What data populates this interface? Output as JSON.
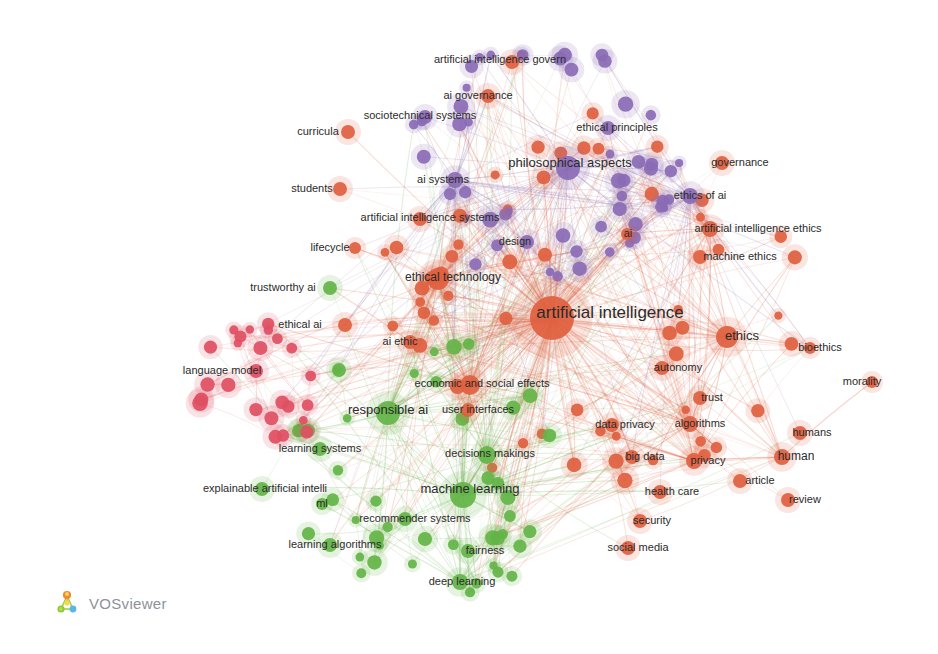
{
  "app": {
    "name": "VOSviewer",
    "logo_label": "VOSviewer",
    "background_color": "#ffffff",
    "width": 938,
    "height": 654
  },
  "chart_data": {
    "type": "scatter",
    "title": "",
    "xlabel": "",
    "ylabel": "",
    "grid": false,
    "legend": "none",
    "visualization": "network",
    "clusters": [
      {
        "id": 1,
        "color": "#e0603f",
        "name": "red-orange"
      },
      {
        "id": 2,
        "color": "#63b446",
        "name": "green"
      },
      {
        "id": 3,
        "color": "#8a6bb5",
        "name": "purple"
      },
      {
        "id": 4,
        "color": "#df4f63",
        "name": "crimson"
      }
    ],
    "nodes": [
      {
        "label": "artificial intelligence",
        "x": 552,
        "y": 318,
        "r": 22,
        "cluster": 1,
        "font": 17,
        "lx": 610,
        "ly": 312
      },
      {
        "label": "philosophical aspects",
        "x": 568,
        "y": 168,
        "r": 12,
        "cluster": 3,
        "font": 13,
        "lx": 570,
        "ly": 163
      },
      {
        "label": "machine learning",
        "x": 463,
        "y": 495,
        "r": 13,
        "cluster": 2,
        "font": 13,
        "lx": 470,
        "ly": 489
      },
      {
        "label": "responsible ai",
        "x": 388,
        "y": 413,
        "r": 12,
        "cluster": 2,
        "font": 13,
        "lx": 388,
        "ly": 410
      },
      {
        "label": "ethics",
        "x": 727,
        "y": 337,
        "r": 11,
        "cluster": 1,
        "font": 13,
        "lx": 742,
        "ly": 336
      },
      {
        "label": "ethical technology",
        "x": 438,
        "y": 279,
        "r": 11,
        "cluster": 1,
        "font": 12,
        "lx": 453,
        "ly": 277
      },
      {
        "label": "economic and social effects",
        "x": 470,
        "y": 385,
        "r": 10,
        "cluster": 1,
        "font": 11,
        "lx": 482,
        "ly": 383
      },
      {
        "label": "artificial intelligence ethics",
        "x": 710,
        "y": 229,
        "r": 8,
        "cluster": 1,
        "font": 11,
        "lx": 758,
        "ly": 228
      },
      {
        "label": "decisions makings",
        "x": 487,
        "y": 455,
        "r": 9,
        "cluster": 2,
        "font": 11,
        "lx": 490,
        "ly": 453
      },
      {
        "label": "artificial intelligence systems",
        "x": 420,
        "y": 219,
        "r": 7,
        "cluster": 1,
        "font": 11,
        "lx": 430,
        "ly": 217
      },
      {
        "label": "artificial intelligence govern",
        "x": 512,
        "y": 62,
        "r": 7,
        "cluster": 1,
        "font": 11,
        "lx": 500,
        "ly": 59
      },
      {
        "label": "sociotechnical systems",
        "x": 425,
        "y": 117,
        "r": 7,
        "cluster": 3,
        "font": 11,
        "lx": 420,
        "ly": 115
      },
      {
        "label": "ethical principles",
        "x": 608,
        "y": 128,
        "r": 7,
        "cluster": 3,
        "font": 11,
        "lx": 617,
        "ly": 127
      },
      {
        "label": "explainable artificial intelli",
        "x": 262,
        "y": 489,
        "r": 7,
        "cluster": 2,
        "font": 11,
        "lx": 265,
        "ly": 488
      },
      {
        "label": "recommender systems",
        "x": 405,
        "y": 519,
        "r": 7,
        "cluster": 2,
        "font": 11,
        "lx": 415,
        "ly": 518
      },
      {
        "label": "learning algorithms",
        "x": 330,
        "y": 545,
        "r": 7,
        "cluster": 2,
        "font": 11,
        "lx": 335,
        "ly": 544
      },
      {
        "label": "learning systems",
        "x": 320,
        "y": 449,
        "r": 7,
        "cluster": 2,
        "font": 11,
        "lx": 320,
        "ly": 448
      },
      {
        "label": "deep learning",
        "x": 460,
        "y": 582,
        "r": 8,
        "cluster": 2,
        "font": 11,
        "lx": 462,
        "ly": 581
      },
      {
        "label": "fairness",
        "x": 468,
        "y": 551,
        "r": 7,
        "cluster": 2,
        "font": 11,
        "lx": 485,
        "ly": 550
      },
      {
        "label": "user interfaces",
        "x": 468,
        "y": 410,
        "r": 7,
        "cluster": 1,
        "font": 11,
        "lx": 478,
        "ly": 409
      },
      {
        "label": "data privacy",
        "x": 612,
        "y": 425,
        "r": 7,
        "cluster": 1,
        "font": 11,
        "lx": 625,
        "ly": 424
      },
      {
        "label": "big data",
        "x": 632,
        "y": 457,
        "r": 7,
        "cluster": 1,
        "font": 11,
        "lx": 645,
        "ly": 456
      },
      {
        "label": "privacy",
        "x": 694,
        "y": 461,
        "r": 8,
        "cluster": 1,
        "font": 11,
        "lx": 708,
        "ly": 460
      },
      {
        "label": "algorithms",
        "x": 690,
        "y": 424,
        "r": 8,
        "cluster": 1,
        "font": 11,
        "lx": 700,
        "ly": 423
      },
      {
        "label": "trust",
        "x": 700,
        "y": 398,
        "r": 7,
        "cluster": 1,
        "font": 11,
        "lx": 712,
        "ly": 397
      },
      {
        "label": "autonomy",
        "x": 662,
        "y": 368,
        "r": 7,
        "cluster": 1,
        "font": 11,
        "lx": 678,
        "ly": 367
      },
      {
        "label": "humans",
        "x": 800,
        "y": 433,
        "r": 7,
        "cluster": 1,
        "font": 11,
        "lx": 812,
        "ly": 432
      },
      {
        "label": "human",
        "x": 782,
        "y": 457,
        "r": 8,
        "cluster": 1,
        "font": 12,
        "lx": 796,
        "ly": 456
      },
      {
        "label": "article",
        "x": 740,
        "y": 481,
        "r": 7,
        "cluster": 1,
        "font": 11,
        "lx": 760,
        "ly": 480
      },
      {
        "label": "review",
        "x": 788,
        "y": 500,
        "r": 7,
        "cluster": 1,
        "font": 11,
        "lx": 805,
        "ly": 499
      },
      {
        "label": "bioethics",
        "x": 810,
        "y": 348,
        "r": 6,
        "cluster": 1,
        "font": 11,
        "lx": 820,
        "ly": 347
      },
      {
        "label": "morality",
        "x": 872,
        "y": 382,
        "r": 6,
        "cluster": 1,
        "font": 11,
        "lx": 862,
        "ly": 381
      },
      {
        "label": "health care",
        "x": 660,
        "y": 492,
        "r": 7,
        "cluster": 1,
        "font": 11,
        "lx": 672,
        "ly": 491
      },
      {
        "label": "security",
        "x": 640,
        "y": 521,
        "r": 7,
        "cluster": 1,
        "font": 11,
        "lx": 652,
        "ly": 520
      },
      {
        "label": "social media",
        "x": 628,
        "y": 548,
        "r": 7,
        "cluster": 1,
        "font": 11,
        "lx": 638,
        "ly": 547
      },
      {
        "label": "machine ethics",
        "x": 700,
        "y": 257,
        "r": 7,
        "cluster": 1,
        "font": 11,
        "lx": 740,
        "ly": 256
      },
      {
        "label": "ethics of ai",
        "x": 690,
        "y": 196,
        "r": 8,
        "cluster": 3,
        "font": 11,
        "lx": 700,
        "ly": 195
      },
      {
        "label": "governance",
        "x": 722,
        "y": 163,
        "r": 7,
        "cluster": 1,
        "font": 11,
        "lx": 740,
        "ly": 162
      },
      {
        "label": "ai governance",
        "x": 488,
        "y": 96,
        "r": 7,
        "cluster": 1,
        "font": 11,
        "lx": 478,
        "ly": 95
      },
      {
        "label": "ai systems",
        "x": 455,
        "y": 180,
        "r": 8,
        "cluster": 3,
        "font": 11,
        "lx": 443,
        "ly": 179
      },
      {
        "label": "design",
        "x": 527,
        "y": 242,
        "r": 7,
        "cluster": 3,
        "font": 11,
        "lx": 515,
        "ly": 241
      },
      {
        "label": "ai",
        "x": 627,
        "y": 234,
        "r": 6,
        "cluster": 1,
        "font": 11,
        "lx": 628,
        "ly": 233
      },
      {
        "label": "students",
        "x": 340,
        "y": 189,
        "r": 7,
        "cluster": 1,
        "font": 11,
        "lx": 312,
        "ly": 188
      },
      {
        "label": "curricula",
        "x": 348,
        "y": 132,
        "r": 7,
        "cluster": 1,
        "font": 11,
        "lx": 318,
        "ly": 131
      },
      {
        "label": "lifecycle",
        "x": 355,
        "y": 248,
        "r": 6,
        "cluster": 1,
        "font": 11,
        "lx": 330,
        "ly": 247
      },
      {
        "label": "trustworthy ai",
        "x": 330,
        "y": 288,
        "r": 7,
        "cluster": 2,
        "font": 11,
        "lx": 283,
        "ly": 287
      },
      {
        "label": "ethical ai",
        "x": 345,
        "y": 325,
        "r": 7,
        "cluster": 1,
        "font": 11,
        "lx": 300,
        "ly": 324
      },
      {
        "label": "ai ethic",
        "x": 410,
        "y": 342,
        "r": 7,
        "cluster": 1,
        "font": 11,
        "lx": 400,
        "ly": 341
      },
      {
        "label": "language model",
        "x": 256,
        "y": 371,
        "r": 7,
        "cluster": 4,
        "font": 11,
        "lx": 222,
        "ly": 370
      },
      {
        "label": "ml",
        "x": 322,
        "y": 504,
        "r": 6,
        "cluster": 2,
        "font": 11,
        "lx": 322,
        "ly": 503
      }
    ],
    "node_count_estimate": 210,
    "edge_density": "high",
    "largest_node": "artificial intelligence"
  }
}
